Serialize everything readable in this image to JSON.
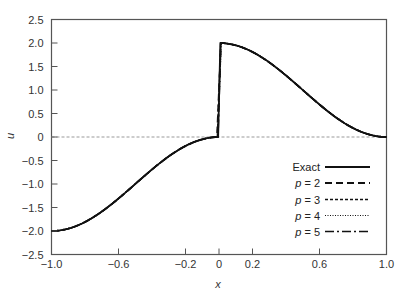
{
  "chart_data": {
    "type": "line",
    "title": "",
    "xlabel": "x",
    "ylabel": "u",
    "xlim": [
      -1.0,
      1.0
    ],
    "ylim": [
      -2.5,
      2.5
    ],
    "xticks": [
      -1.0,
      -0.6,
      -0.2,
      0,
      0.2,
      0.6,
      1.0
    ],
    "xtick_labels": [
      "−1.0",
      "−0.6",
      "−0.2",
      "0",
      "0.2",
      "0.6",
      "1.0"
    ],
    "yticks": [
      2.5,
      2.0,
      1.5,
      1.0,
      0.5,
      0,
      -0.5,
      -1.0,
      -1.5,
      -2.0,
      -2.5
    ],
    "ytick_labels": [
      "2.5",
      "2.0",
      "1.5",
      "1.0",
      "0.5",
      "0",
      "−0.5",
      "−1.0",
      "−1.5",
      "−2.0",
      "−2.5"
    ],
    "grid": false,
    "reference_line": {
      "y": 0,
      "style": "dashed",
      "color": "#999999"
    },
    "legend_position": "lower right",
    "series": [
      {
        "name": "Exact",
        "style": "solid",
        "x": [
          -1.0,
          -0.9,
          -0.8,
          -0.7,
          -0.6,
          -0.5,
          -0.4,
          -0.3,
          -0.2,
          -0.1,
          0.0,
          0.0,
          0.1,
          0.2,
          0.3,
          0.4,
          0.5,
          0.6,
          0.7,
          0.8,
          0.9,
          1.0
        ],
        "values": [
          -2.0,
          -1.951,
          -1.809,
          -1.588,
          -1.309,
          -1.0,
          -0.691,
          -0.412,
          -0.191,
          -0.049,
          0.0,
          2.0,
          1.951,
          1.809,
          1.588,
          1.309,
          1.0,
          0.691,
          0.412,
          0.191,
          0.049,
          0.0
        ]
      },
      {
        "name": "p = 2",
        "style": "dashed",
        "x": [
          -1.0,
          -0.5,
          -0.02,
          0.02,
          0.5,
          1.0
        ],
        "values": [
          -2.0,
          -1.0,
          -0.004,
          1.998,
          1.0,
          0.0
        ]
      },
      {
        "name": "p = 3",
        "style": "dotted-short-dash",
        "x": [
          -1.0,
          -0.5,
          -0.02,
          0.02,
          0.5,
          1.0
        ],
        "values": [
          -2.0,
          -1.0,
          -0.004,
          1.998,
          1.0,
          0.0
        ]
      },
      {
        "name": "p = 4",
        "style": "dotted",
        "x": [
          -1.0,
          -0.5,
          -0.02,
          0.02,
          0.5,
          1.0
        ],
        "values": [
          -2.0,
          -1.0,
          -0.004,
          1.998,
          1.0,
          0.0
        ]
      },
      {
        "name": "p = 5",
        "style": "dash-dot",
        "x": [
          -1.0,
          -0.5,
          -0.02,
          0.02,
          0.5,
          1.0
        ],
        "values": [
          -2.0,
          -1.0,
          -0.004,
          1.998,
          1.0,
          0.0
        ]
      }
    ],
    "annotations": []
  },
  "legend": {
    "items": [
      {
        "prefix": "",
        "label": "Exact"
      },
      {
        "prefix": "p",
        "label": " = 2"
      },
      {
        "prefix": "p",
        "label": " = 3"
      },
      {
        "prefix": "p",
        "label": " = 4"
      },
      {
        "prefix": "p",
        "label": " = 5"
      }
    ]
  },
  "axes": {
    "xlabel": "x",
    "ylabel": "u"
  }
}
